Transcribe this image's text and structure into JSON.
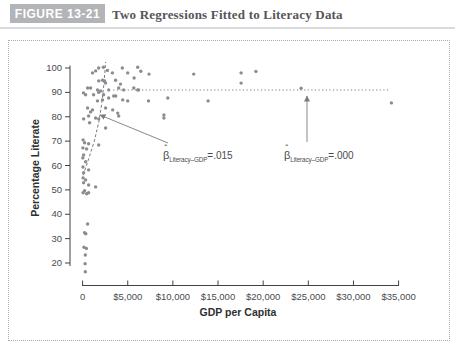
{
  "header": {
    "figure_label": "FIGURE 13-21",
    "title": "Two Regressions Fitted to Literacy Data"
  },
  "chart_data": {
    "type": "scatter",
    "xlabel": "GDP per Capita",
    "ylabel": "Percentage Literate",
    "x_tick_labels": [
      "0",
      "$5,000",
      "$10,000",
      "$15,000",
      "$20,000",
      "$25,000",
      "$30,000",
      "$35,000"
    ],
    "x_tick_values": [
      0,
      5000,
      10000,
      15000,
      20000,
      25000,
      30000,
      35000
    ],
    "y_tick_values": [
      100,
      90,
      80,
      70,
      60,
      50,
      40,
      30,
      20
    ],
    "xlim": [
      0,
      35000
    ],
    "ylim": [
      10.5,
      103
    ],
    "grid": false,
    "point_color": "#8a8c8f",
    "line_color": "#7a7c7f",
    "axis_color": "#414245",
    "text_color": "#4a4b4e",
    "points": [
      [
        1100,
        98
      ],
      [
        1450,
        98.8
      ],
      [
        1780,
        100
      ],
      [
        2300,
        100.3
      ],
      [
        2750,
        99
      ],
      [
        3300,
        98
      ],
      [
        4400,
        100
      ],
      [
        5000,
        98
      ],
      [
        6100,
        100.3
      ],
      [
        6450,
        98.7
      ],
      [
        5700,
        95.9
      ],
      [
        2200,
        95
      ],
      [
        2550,
        93.8
      ],
      [
        1780,
        94.7
      ],
      [
        2440,
        94.7
      ],
      [
        3660,
        95
      ],
      [
        4200,
        93.4
      ],
      [
        550,
        91.8
      ],
      [
        890,
        91.8
      ],
      [
        1650,
        91
      ],
      [
        2000,
        90.6
      ],
      [
        2890,
        91
      ],
      [
        4000,
        91.8
      ],
      [
        4550,
        91
      ],
      [
        5670,
        91.8
      ],
      [
        6200,
        91
      ],
      [
        6100,
        91
      ],
      [
        100,
        89.8
      ],
      [
        330,
        89
      ],
      [
        1220,
        89
      ],
      [
        2330,
        89
      ],
      [
        3670,
        88.5
      ],
      [
        3440,
        88.5
      ],
      [
        1780,
        90
      ],
      [
        2890,
        87.7
      ],
      [
        2200,
        86.9
      ],
      [
        1650,
        86.5
      ],
      [
        4440,
        86.9
      ],
      [
        5000,
        86.5
      ],
      [
        7300,
        86.5
      ],
      [
        550,
        83.6
      ],
      [
        1100,
        82.8
      ],
      [
        2550,
        83.6
      ],
      [
        3330,
        82.8
      ],
      [
        890,
        82
      ],
      [
        670,
        80.3
      ],
      [
        1440,
        79.5
      ],
      [
        3890,
        81.5
      ],
      [
        4000,
        80.3
      ],
      [
        110,
        79.1
      ],
      [
        1780,
        79.1
      ],
      [
        780,
        77.5
      ],
      [
        2550,
        75.4
      ],
      [
        50,
        70.5
      ],
      [
        220,
        69.3
      ],
      [
        670,
        68.9
      ],
      [
        1780,
        68.4
      ],
      [
        30,
        67.2
      ],
      [
        440,
        66.8
      ],
      [
        110,
        64.3
      ],
      [
        20,
        63.1
      ],
      [
        330,
        61.5
      ],
      [
        40,
        59.4
      ],
      [
        670,
        58.2
      ],
      [
        110,
        57
      ],
      [
        60,
        54.9
      ],
      [
        330,
        54.1
      ],
      [
        110,
        52.9
      ],
      [
        670,
        52
      ],
      [
        1440,
        51.2
      ],
      [
        220,
        49.6
      ],
      [
        50,
        48.8
      ],
      [
        440,
        48.4
      ],
      [
        670,
        48.8
      ],
      [
        550,
        36
      ],
      [
        220,
        32.4
      ],
      [
        350,
        32
      ],
      [
        150,
        26.5
      ],
      [
        420,
        26
      ],
      [
        300,
        23.3
      ],
      [
        280,
        19.7
      ],
      [
        300,
        16.4
      ],
      [
        7350,
        97.5
      ],
      [
        12300,
        97.5
      ],
      [
        17550,
        98
      ],
      [
        19200,
        98.6
      ],
      [
        17550,
        93.8
      ],
      [
        9440,
        87.7
      ],
      [
        13900,
        86.5
      ],
      [
        9000,
        80.7
      ],
      [
        9000,
        79.5
      ],
      [
        24200,
        91.7
      ],
      [
        34200,
        85.7
      ]
    ],
    "regressions": [
      {
        "id": "steep-regression",
        "slope_value": ".015",
        "line_style": "dashed",
        "path_points": [
          [
            50,
            56
          ],
          [
            700,
            63
          ],
          [
            1300,
            70
          ],
          [
            1800,
            78
          ],
          [
            2100,
            85
          ],
          [
            2350,
            93
          ],
          [
            2500,
            100
          ],
          [
            2550,
            102.5
          ]
        ]
      },
      {
        "id": "flat-regression",
        "slope_value": ".000",
        "line_style": "dotted",
        "literacy": 91,
        "gdp_range": [
          3400,
          34100
        ]
      }
    ],
    "annotations": [
      {
        "id": "beta-literacy-gdp-015",
        "beta": "β",
        "hat": "ˆ",
        "sub": "Literacy–GDP",
        "value": "=.015",
        "label_px": [
          163,
          159
        ],
        "arrow_from": [
          168,
          143
        ],
        "arrow_to": [
          100,
          115
        ]
      },
      {
        "id": "beta-literacy-gdp-000",
        "beta": "β",
        "hat": "ˆ",
        "sub": "Literacy–GDP",
        "value": "=.000",
        "label_px": [
          284,
          159
        ],
        "arrow_from": [
          307,
          142
        ],
        "arrow_to": [
          307,
          96
        ]
      }
    ]
  }
}
